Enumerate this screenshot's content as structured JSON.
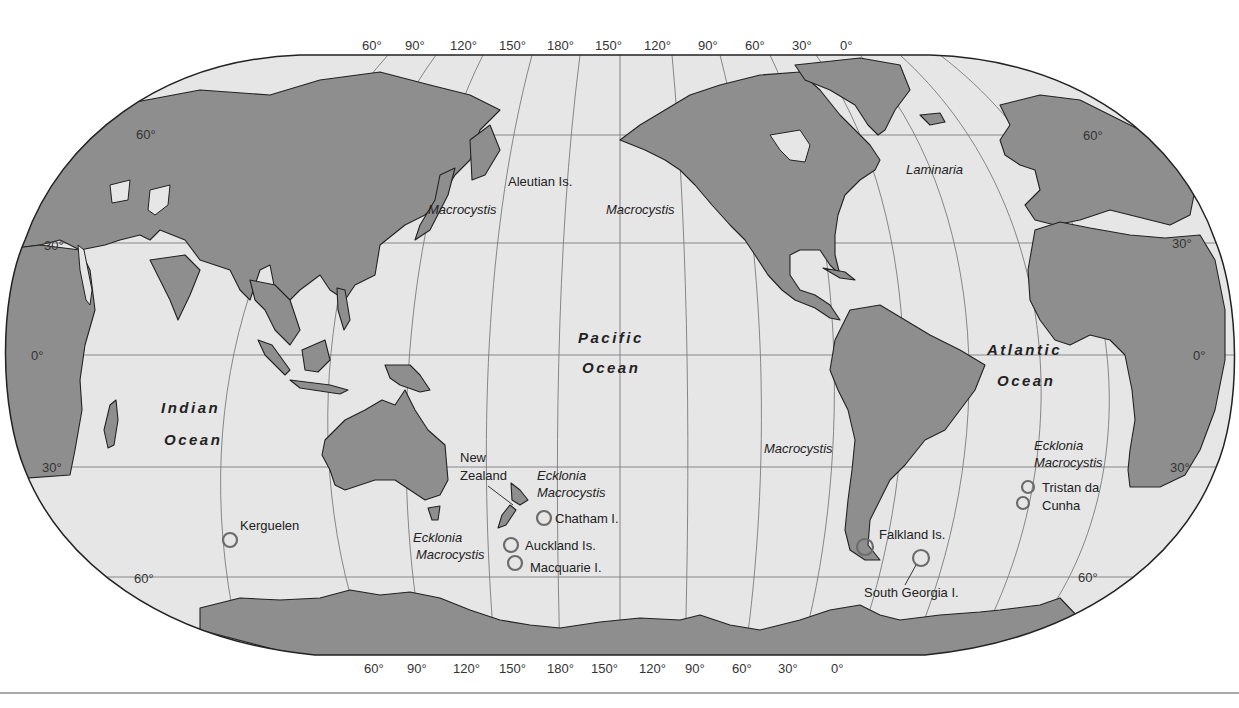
{
  "map": {
    "projection": "Robinson (Pacific-centered)",
    "colors": {
      "ocean": "#e6e6e6",
      "land": "#8e8e8e",
      "outline": "#222222",
      "grid": "#7a7a7a",
      "site_circle": "#6c6c6c"
    },
    "top_longitude_labels": [
      "60°",
      "90°",
      "120°",
      "150°",
      "180°",
      "150°",
      "120°",
      "90°",
      "60°",
      "30°",
      "0°"
    ],
    "bottom_longitude_labels": [
      "60°",
      "90°",
      "120°",
      "150°",
      "180°",
      "150°",
      "120°",
      "90°",
      "60°",
      "30°",
      "0°"
    ],
    "left_latitude_labels": [
      "60°",
      "30°",
      "0°",
      "30°",
      "60°"
    ],
    "right_latitude_labels": [
      "60°",
      "30°",
      "0°",
      "30°",
      "60°"
    ],
    "oceans": [
      {
        "line1": "Pacific",
        "line2": "Ocean"
      },
      {
        "line1": "Indian",
        "line2": "Ocean"
      },
      {
        "line1": "Atlantic",
        "line2": "Ocean"
      }
    ],
    "places": {
      "aleutian": "Aleutian Is.",
      "kerguelen": "Kerguelen",
      "nz_line1": "New",
      "nz_line2": "Zealand",
      "chatham": "Chatham I.",
      "auckland": "Auckland Is.",
      "macquarie": "Macquarie I.",
      "falkland": "Falkland Is.",
      "south_georgia": "South Georgia I.",
      "tristan_line1": "Tristan da",
      "tristan_line2": "Cunha"
    },
    "kelp_genera": {
      "macrocystis_nw_pacific": "Macrocystis",
      "macrocystis_ne_pacific": "Macrocystis",
      "laminaria": "Laminaria",
      "macrocystis_se_pacific": "Macrocystis",
      "nz_ecklonia": "Ecklonia",
      "nz_macrocystis": "Macrocystis",
      "aus_ecklonia": "Ecklonia",
      "aus_macrocystis": "Macrocystis",
      "sa_ecklonia": "Ecklonia",
      "sa_macrocystis": "Macrocystis"
    }
  }
}
